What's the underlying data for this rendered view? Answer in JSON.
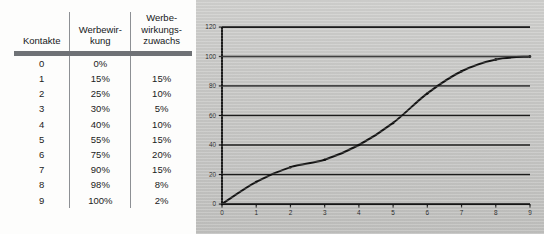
{
  "table": {
    "headers": [
      "Kontakte",
      "Werbewir-\nkung",
      "Werbe-\nwirkungs-\nzuwachs"
    ],
    "header_lines": {
      "col0": [
        "Kontakte"
      ],
      "col1": [
        "Werbewir-",
        "kung"
      ],
      "col2": [
        "Werbe-",
        "wirkungs-",
        "zuwachs"
      ]
    },
    "rows": [
      {
        "kontakte": "0",
        "werbewirkung": "0%",
        "zuwachs": ""
      },
      {
        "kontakte": "1",
        "werbewirkung": "15%",
        "zuwachs": "15%"
      },
      {
        "kontakte": "2",
        "werbewirkung": "25%",
        "zuwachs": "10%"
      },
      {
        "kontakte": "3",
        "werbewirkung": "30%",
        "zuwachs": "5%"
      },
      {
        "kontakte": "4",
        "werbewirkung": "40%",
        "zuwachs": "10%"
      },
      {
        "kontakte": "5",
        "werbewirkung": "55%",
        "zuwachs": "15%"
      },
      {
        "kontakte": "6",
        "werbewirkung": "75%",
        "zuwachs": "20%"
      },
      {
        "kontakte": "7",
        "werbewirkung": "90%",
        "zuwachs": "15%"
      },
      {
        "kontakte": "8",
        "werbewirkung": "98%",
        "zuwachs": "8%"
      },
      {
        "kontakte": "9",
        "werbewirkung": "100%",
        "zuwachs": "2%"
      }
    ]
  },
  "chart_data": {
    "type": "line",
    "title": "",
    "xlabel": "",
    "ylabel": "",
    "x": [
      0,
      1,
      2,
      3,
      4,
      5,
      6,
      7,
      8,
      9
    ],
    "values": [
      0,
      15,
      25,
      30,
      40,
      55,
      75,
      90,
      98,
      100
    ],
    "series": [
      {
        "name": "Werbewirkung",
        "values": [
          0,
          15,
          25,
          30,
          40,
          55,
          75,
          90,
          98,
          100
        ]
      }
    ],
    "xlim": [
      0,
      9
    ],
    "ylim": [
      0,
      120
    ],
    "xticks": [
      "0",
      "1",
      "2",
      "3",
      "4",
      "5",
      "6",
      "7",
      "8",
      "9"
    ],
    "yticks": [
      "0",
      "20",
      "40",
      "60",
      "80",
      "100",
      "120"
    ],
    "ytick_values": [
      0,
      20,
      40,
      60,
      80,
      100,
      120
    ],
    "grid": true,
    "grid_axis": "y",
    "legend": false,
    "markers": true,
    "line_color": "#141414",
    "grid_color": "#1c1c1c",
    "axis_color": "#141414",
    "panel_color": "#c6c6c4"
  }
}
